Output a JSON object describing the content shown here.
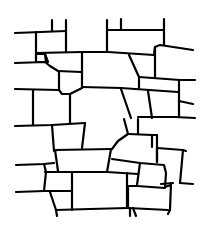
{
  "image": {
    "subject": "stone wall line drawing",
    "width": 209,
    "height": 236,
    "background": "#ffffff",
    "stroke_color": "#000000"
  }
}
